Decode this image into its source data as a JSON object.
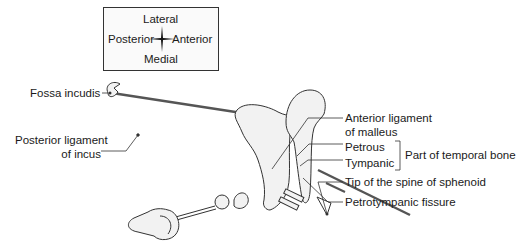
{
  "compass": {
    "top": "Lateral",
    "left": "Posterior",
    "right": "Anterior",
    "bottom": "Medial"
  },
  "labels": {
    "fossa_incudis": "Fossa incudis",
    "posterior_ligament_line1": "Posterior ligament",
    "posterior_ligament_line2": "of incus",
    "anterior_ligament_line1": "Anterior ligament",
    "anterior_ligament_line2": "of malleus",
    "petrous": "Petrous",
    "tympanic": "Tympanic",
    "part_of_temporal_bone": "Part of temporal bone",
    "tip_spine_sphenoid": "Tip of the spine of sphenoid",
    "petrotympanic_fissure": "Petrotympanic fissure"
  },
  "colors": {
    "line": "#333333",
    "bone_fill": "#f2f2f2",
    "ligament": "#555555"
  }
}
